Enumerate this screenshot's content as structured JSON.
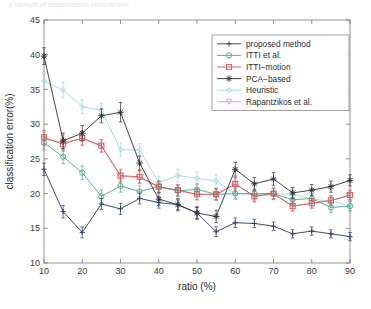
{
  "figure": {
    "top_text_fragment": "a sample of  experiments    comparison",
    "background_color": "#ffffff"
  },
  "chart_data": {
    "type": "line",
    "title": "",
    "xlabel": "ratio (%)",
    "ylabel": "classification error(%)",
    "xlim": [
      10,
      90
    ],
    "ylim": [
      10,
      45
    ],
    "xticks": [
      10,
      20,
      30,
      40,
      50,
      60,
      70,
      80,
      90
    ],
    "yticks": [
      10,
      15,
      20,
      25,
      30,
      35,
      40,
      45
    ],
    "xtick_labels": [
      "10",
      "20",
      "30",
      "40",
      "50",
      "60",
      "70",
      "80",
      "90"
    ],
    "ytick_labels": [
      "10",
      "15",
      "20",
      "25",
      "30",
      "35",
      "40",
      "45"
    ],
    "grid": false,
    "legend_position": "upper right",
    "x": [
      10,
      15,
      20,
      25,
      30,
      35,
      40,
      45,
      50,
      55,
      60,
      65,
      70,
      75,
      80,
      85,
      90
    ],
    "series": [
      {
        "name": "proposed method",
        "color": "#2b3a67",
        "marker": "plus",
        "values": [
          23.5,
          17.4,
          14.4,
          18.5,
          17.8,
          19.3,
          18.7,
          18.4,
          17.2,
          14.5,
          15.8,
          15.7,
          15.3,
          14.2,
          14.6,
          14.2,
          13.8
        ],
        "errors": [
          0.9,
          0.9,
          0.8,
          0.8,
          0.8,
          0.8,
          0.8,
          0.7,
          0.8,
          0.7,
          0.7,
          0.6,
          0.6,
          0.6,
          0.6,
          0.6,
          0.6
        ]
      },
      {
        "name": "ITTI et al.",
        "color": "#49a88a",
        "marker": "circle",
        "values": [
          27.3,
          25.3,
          23.0,
          19.6,
          21.1,
          20.3,
          21.0,
          20.4,
          20.6,
          19.9,
          20.0,
          20.0,
          20.0,
          19.1,
          19.3,
          18.0,
          18.2
        ],
        "errors": [
          1.0,
          1.0,
          1.0,
          0.9,
          0.9,
          0.8,
          0.8,
          0.8,
          0.8,
          0.8,
          0.8,
          0.7,
          0.7,
          0.7,
          0.7,
          0.7,
          0.7
        ]
      },
      {
        "name": "ITTI−motion",
        "color": "#d9534f",
        "marker": "square",
        "values": [
          28.1,
          27.1,
          28.0,
          26.9,
          22.6,
          22.4,
          21.0,
          20.5,
          19.9,
          19.9,
          21.4,
          19.6,
          20.0,
          18.2,
          18.6,
          19.0,
          19.8
        ],
        "errors": [
          1.0,
          1.0,
          1.0,
          0.9,
          0.9,
          0.9,
          0.8,
          0.8,
          0.8,
          0.8,
          0.9,
          0.8,
          0.8,
          0.7,
          0.7,
          0.7,
          0.7
        ]
      },
      {
        "name": "PCA−based",
        "color": "#2f2f2f",
        "marker": "star",
        "values": [
          39.8,
          27.6,
          28.7,
          31.2,
          31.7,
          24.4,
          19.2,
          18.4,
          17.2,
          16.7,
          23.5,
          21.4,
          22.1,
          20.1,
          20.5,
          21.0,
          21.9
        ],
        "errors": [
          1.2,
          1.1,
          1.1,
          1.0,
          1.4,
          1.0,
          0.9,
          0.9,
          0.9,
          0.9,
          1.0,
          0.9,
          0.9,
          0.8,
          0.8,
          0.8,
          0.8
        ]
      },
      {
        "name": "Heuristic",
        "color": "#9fd8e0",
        "marker": "diamond",
        "values": [
          36.2,
          34.9,
          32.5,
          32.0,
          26.3,
          26.3,
          21.6,
          22.6,
          22.2,
          21.8,
          20.0,
          19.8,
          20.0,
          19.9,
          19.2,
          18.9,
          18.2
        ],
        "errors": [
          1.1,
          1.1,
          1.0,
          1.0,
          1.0,
          0.9,
          0.9,
          0.9,
          0.9,
          0.9,
          0.8,
          0.8,
          0.8,
          0.8,
          0.7,
          0.7,
          0.7
        ]
      },
      {
        "name": "Rapantzikos et al.",
        "color": "#c9a8cf",
        "marker": "triangle-down",
        "values": [
          27.8,
          27.4,
          27.9,
          26.8,
          22.5,
          22.3,
          20.9,
          20.4,
          19.9,
          19.8,
          21.3,
          19.6,
          19.9,
          18.2,
          18.6,
          19.0,
          19.7
        ],
        "errors": [
          1.0,
          1.0,
          1.0,
          0.9,
          0.9,
          0.9,
          0.8,
          0.8,
          0.8,
          0.8,
          0.9,
          0.8,
          0.8,
          0.7,
          0.7,
          0.7,
          0.7
        ]
      }
    ]
  }
}
